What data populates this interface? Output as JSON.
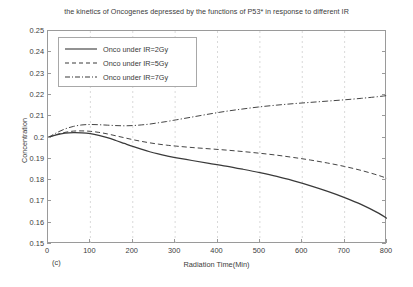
{
  "figure": {
    "panel_label": "(c)",
    "title": "the kinetics of Oncogenes depressed by the functions of P53* in response to different IR"
  },
  "axes": {
    "xlabel": "Radiation Time(Min)",
    "ylabel": "Concentration",
    "xticks": [
      "0",
      "100",
      "200",
      "300",
      "400",
      "500",
      "600",
      "700",
      "800"
    ],
    "yticks": [
      "0.25",
      "0.24",
      "0.23",
      "0.22",
      "0.21",
      "0.2",
      "0.19",
      "0.18",
      "0.17",
      "0.16",
      "0.15"
    ]
  },
  "legend": {
    "entries": [
      {
        "label": "Onco under IR=2Gy",
        "style": "solid"
      },
      {
        "label": "Onco under IR=5Gy",
        "style": "dashed"
      },
      {
        "label": "Onco under IR=7Gy",
        "style": "dash-dot"
      }
    ]
  },
  "colors": {
    "line": "#3a3a3a",
    "axis": "#9a9a9a",
    "grid": "#c9c9c9",
    "text": "#3c3c3c",
    "background": "#ffffff"
  },
  "chart_data": {
    "type": "line",
    "title": "the kinetics of Oncogenes depressed by the functions of P53* in response to different IR",
    "xlabel": "Radiation Time(Min)",
    "ylabel": "Concentration",
    "xlim": [
      0,
      800
    ],
    "ylim": [
      0.15,
      0.25
    ],
    "xticks": [
      0,
      100,
      200,
      300,
      400,
      500,
      600,
      700,
      800
    ],
    "yticks": [
      0.15,
      0.16,
      0.17,
      0.18,
      0.19,
      0.2,
      0.21,
      0.22,
      0.23,
      0.24,
      0.25
    ],
    "grid": "vertical-dashed",
    "legend_position": "upper-left",
    "x": [
      0,
      20,
      40,
      60,
      80,
      100,
      120,
      140,
      160,
      180,
      200,
      220,
      240,
      260,
      280,
      300,
      340,
      380,
      420,
      460,
      500,
      540,
      580,
      620,
      660,
      700,
      740,
      780,
      800
    ],
    "series": [
      {
        "name": "Onco under IR=2Gy",
        "style": "solid",
        "values": [
          0.2,
          0.2012,
          0.202,
          0.2023,
          0.2022,
          0.2018,
          0.201,
          0.1999,
          0.1986,
          0.1972,
          0.1958,
          0.1945,
          0.1933,
          0.1923,
          0.1914,
          0.1906,
          0.1892,
          0.1879,
          0.1866,
          0.1851,
          0.1835,
          0.1817,
          0.1796,
          0.1773,
          0.1747,
          0.1718,
          0.1685,
          0.1645,
          0.162
        ]
      },
      {
        "name": "Onco under IR=5Gy",
        "style": "dashed",
        "values": [
          0.2,
          0.2014,
          0.2024,
          0.203,
          0.2031,
          0.2029,
          0.2024,
          0.2017,
          0.2008,
          0.1999,
          0.199,
          0.1982,
          0.1975,
          0.1969,
          0.1964,
          0.196,
          0.1953,
          0.1947,
          0.1941,
          0.1934,
          0.1926,
          0.1917,
          0.1906,
          0.1894,
          0.188,
          0.1864,
          0.1845,
          0.1822,
          0.1808
        ]
      },
      {
        "name": "Onco under IR=7Gy",
        "style": "dash-dot",
        "values": [
          0.2,
          0.2022,
          0.204,
          0.2052,
          0.2059,
          0.2061,
          0.206,
          0.2058,
          0.2056,
          0.2055,
          0.2056,
          0.2059,
          0.2063,
          0.2069,
          0.2075,
          0.2082,
          0.2096,
          0.211,
          0.2123,
          0.2134,
          0.2144,
          0.2152,
          0.2159,
          0.2165,
          0.2171,
          0.2177,
          0.2184,
          0.2192,
          0.2197
        ]
      }
    ]
  }
}
